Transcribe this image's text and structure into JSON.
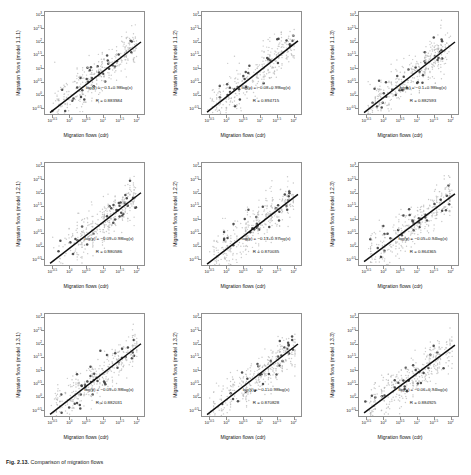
{
  "figure": {
    "caption_label": "Fig. 2.13.",
    "caption_text": "Comparison of migration flows",
    "axis": {
      "xlabel": "Migration flows (cdr)",
      "yticks": [
        "10^-0.5",
        "10^0",
        "10^0.5",
        "10^1",
        "10^1.5",
        "10^2",
        "10^2.5",
        "10^3"
      ],
      "xticks": [
        "10^-0.5",
        "10^0",
        "10^0.5",
        "10^1",
        "10^1.5",
        "10^2"
      ],
      "ytick_exps": [
        "-0.5",
        "0",
        "0.5",
        "1",
        "1.5",
        "2",
        "2.5",
        "3"
      ],
      "xtick_exps": [
        "-0.5",
        "0",
        "0.5",
        "1",
        "1.5",
        "2"
      ]
    },
    "colors": {
      "fit_line": "#111111",
      "scatter_light": "#b9b9b9",
      "scatter_dark": "#3d3d3d",
      "axis": "#8f8f8f",
      "background": "#ffffff"
    }
  },
  "chart_data": {
    "type": "scatter",
    "title": "",
    "xlabel": "Migration flows (cdr)",
    "ylabel": "Migration flows (model)",
    "xscale": "log",
    "yscale": "log",
    "xlim": [
      -0.75,
      2.25
    ],
    "ylim": [
      -0.75,
      3.15
    ],
    "grid": false,
    "legend": "none",
    "panels": [
      {
        "id": "1.1.1",
        "ylabel": "Migration flows (model 1.1.1)",
        "equation": "log(y) = −0.1+0.98log(x)",
        "r_label": "R = 0.883584",
        "slope": 0.98,
        "intercept": -0.1,
        "r": 0.883584
      },
      {
        "id": "1.1.2",
        "ylabel": "Migration flows (model 1.1.2)",
        "equation": "log(y) = −0.08+0.99log(x)",
        "r_label": "R = 0.894715",
        "slope": 0.99,
        "intercept": -0.08,
        "r": 0.894715
      },
      {
        "id": "1.1.3",
        "ylabel": "Migration flows (model 1.1.3)",
        "equation": "log(y) = −0.1+0.98log(x)",
        "r_label": "R = 0.882593",
        "slope": 0.98,
        "intercept": -0.1,
        "r": 0.882593
      },
      {
        "id": "1.2.1",
        "ylabel": "Migration flows (model 1.2.1)",
        "equation": "log(y) = −0.09+0.98log(x)",
        "r_label": "R = 0.880586",
        "slope": 0.98,
        "intercept": -0.09,
        "r": 0.880586
      },
      {
        "id": "1.2.2",
        "ylabel": "Migration flows (model 1.2.2)",
        "equation": "log(y) = −0.13+0.97log(x)",
        "r_label": "R = 0.870035",
        "slope": 0.97,
        "intercept": -0.13,
        "r": 0.870035
      },
      {
        "id": "1.2.3",
        "ylabel": "Migration flows (model 1.2.3)",
        "equation": "log(y) = −0.05+0.94log(x)",
        "r_label": "R = 0.864365",
        "slope": 0.94,
        "intercept": -0.05,
        "r": 0.864365
      },
      {
        "id": "1.3.1",
        "ylabel": "Migration flows (model 1.3.1)",
        "equation": "log(y) = −0.09+0.98log(x)",
        "r_label": "R = 0.882031",
        "slope": 0.98,
        "intercept": -0.09,
        "r": 0.882031
      },
      {
        "id": "1.3.2",
        "ylabel": "Migration flows (model 1.3.2)",
        "equation": "log(y) = −0.1+0.98log(x)",
        "r_label": "R = 0.870828",
        "slope": 0.98,
        "intercept": -0.1,
        "r": 0.870828
      },
      {
        "id": "1.3.3",
        "ylabel": "Migration flows (model 1.3.3)",
        "equation": "log(y) = −0.06+0.94log(x)",
        "r_label": "R = 0.884925",
        "slope": 0.94,
        "intercept": -0.06,
        "r": 0.884925
      }
    ]
  }
}
